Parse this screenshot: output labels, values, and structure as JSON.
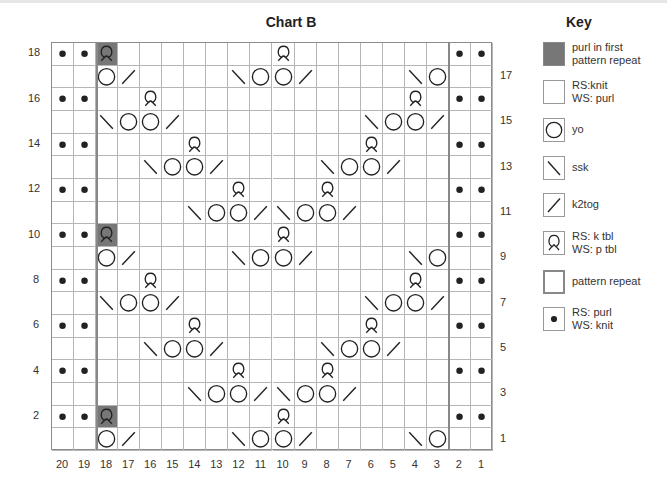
{
  "chart_data": {
    "type": "knitting-chart",
    "title": "Chart B",
    "columns": [
      20,
      19,
      18,
      17,
      16,
      15,
      14,
      13,
      12,
      11,
      10,
      9,
      8,
      7,
      6,
      5,
      4,
      3,
      2,
      1
    ],
    "row_labels_left": [
      18,
      16,
      14,
      12,
      10,
      8,
      6,
      4,
      2
    ],
    "row_labels_right": [
      17,
      15,
      13,
      11,
      9,
      7,
      5,
      3,
      1
    ],
    "pattern_repeat": {
      "from_col": 18,
      "to_col": 3
    },
    "legend_codes": {
      "P": "RS: purl / WS: knit (dot)",
      "Q": "RS: k tbl / WS: p tbl",
      "G": "purl in first pattern repeat + k tbl symbol (grey)",
      "O": "yo",
      "S": "ssk (\\)",
      "K": "k2tog (/)",
      ".": "RS: knit / WS: purl (empty)"
    },
    "rows": [
      {
        "row": 18,
        "cells": [
          "P",
          "P",
          "G",
          ".",
          ".",
          ".",
          ".",
          ".",
          ".",
          ".",
          "Q",
          ".",
          ".",
          ".",
          ".",
          ".",
          ".",
          ".",
          "P",
          "P"
        ]
      },
      {
        "row": 17,
        "cells": [
          ".",
          ".",
          "O",
          "K",
          ".",
          ".",
          ".",
          ".",
          "S",
          "O",
          "O",
          "K",
          ".",
          ".",
          ".",
          ".",
          "S",
          "O",
          ".",
          "."
        ]
      },
      {
        "row": 16,
        "cells": [
          "P",
          "P",
          ".",
          ".",
          "Q",
          ".",
          ".",
          ".",
          ".",
          ".",
          ".",
          ".",
          ".",
          ".",
          ".",
          ".",
          "Q",
          ".",
          "P",
          "P"
        ]
      },
      {
        "row": 15,
        "cells": [
          ".",
          ".",
          "S",
          "O",
          "O",
          "K",
          ".",
          ".",
          ".",
          ".",
          ".",
          ".",
          ".",
          ".",
          "S",
          "O",
          "O",
          "K",
          ".",
          "."
        ]
      },
      {
        "row": 14,
        "cells": [
          "P",
          "P",
          ".",
          ".",
          ".",
          ".",
          "Q",
          ".",
          ".",
          ".",
          ".",
          ".",
          ".",
          ".",
          "Q",
          ".",
          ".",
          ".",
          "P",
          "P"
        ]
      },
      {
        "row": 13,
        "cells": [
          ".",
          ".",
          ".",
          ".",
          "S",
          "O",
          "O",
          "K",
          ".",
          ".",
          ".",
          ".",
          "S",
          "O",
          "O",
          "K",
          ".",
          ".",
          ".",
          "."
        ]
      },
      {
        "row": 12,
        "cells": [
          "P",
          "P",
          ".",
          ".",
          ".",
          ".",
          ".",
          ".",
          "Q",
          ".",
          ".",
          ".",
          "Q",
          ".",
          ".",
          ".",
          ".",
          ".",
          "P",
          "P"
        ]
      },
      {
        "row": 11,
        "cells": [
          ".",
          ".",
          ".",
          ".",
          ".",
          ".",
          "S",
          "O",
          "O",
          "K",
          "S",
          "O",
          "O",
          "K",
          ".",
          ".",
          ".",
          ".",
          ".",
          "."
        ]
      },
      {
        "row": 10,
        "cells": [
          "P",
          "P",
          "G",
          ".",
          ".",
          ".",
          ".",
          ".",
          ".",
          ".",
          "Q",
          ".",
          ".",
          ".",
          ".",
          ".",
          ".",
          ".",
          "P",
          "P"
        ]
      },
      {
        "row": 9,
        "cells": [
          ".",
          ".",
          "O",
          "K",
          ".",
          ".",
          ".",
          ".",
          "S",
          "O",
          "O",
          "K",
          ".",
          ".",
          ".",
          ".",
          "S",
          "O",
          ".",
          "."
        ]
      },
      {
        "row": 8,
        "cells": [
          "P",
          "P",
          ".",
          ".",
          "Q",
          ".",
          ".",
          ".",
          ".",
          ".",
          ".",
          ".",
          ".",
          ".",
          ".",
          ".",
          "Q",
          ".",
          "P",
          "P"
        ]
      },
      {
        "row": 7,
        "cells": [
          ".",
          ".",
          "S",
          "O",
          "O",
          "K",
          ".",
          ".",
          ".",
          ".",
          ".",
          ".",
          ".",
          ".",
          "S",
          "O",
          "O",
          "K",
          ".",
          "."
        ]
      },
      {
        "row": 6,
        "cells": [
          "P",
          "P",
          ".",
          ".",
          ".",
          ".",
          "Q",
          ".",
          ".",
          ".",
          ".",
          ".",
          ".",
          ".",
          "Q",
          ".",
          ".",
          ".",
          "P",
          "P"
        ]
      },
      {
        "row": 5,
        "cells": [
          ".",
          ".",
          ".",
          ".",
          "S",
          "O",
          "O",
          "K",
          ".",
          ".",
          ".",
          ".",
          "S",
          "O",
          "O",
          "K",
          ".",
          ".",
          ".",
          "."
        ]
      },
      {
        "row": 4,
        "cells": [
          "P",
          "P",
          ".",
          ".",
          ".",
          ".",
          ".",
          ".",
          "Q",
          ".",
          ".",
          ".",
          "Q",
          ".",
          ".",
          ".",
          ".",
          ".",
          "P",
          "P"
        ]
      },
      {
        "row": 3,
        "cells": [
          ".",
          ".",
          ".",
          ".",
          ".",
          ".",
          "S",
          "O",
          "O",
          "K",
          "S",
          "O",
          "O",
          "K",
          ".",
          ".",
          ".",
          ".",
          ".",
          "."
        ]
      },
      {
        "row": 2,
        "cells": [
          "P",
          "P",
          "G",
          ".",
          ".",
          ".",
          ".",
          ".",
          ".",
          ".",
          "Q",
          ".",
          ".",
          ".",
          ".",
          ".",
          ".",
          ".",
          "P",
          "P"
        ]
      },
      {
        "row": 1,
        "cells": [
          ".",
          ".",
          "O",
          "K",
          ".",
          ".",
          ".",
          ".",
          "S",
          "O",
          "O",
          "K",
          ".",
          ".",
          ".",
          ".",
          "S",
          "O",
          ".",
          "."
        ]
      }
    ]
  },
  "chart": {
    "title": "Chart B"
  },
  "key": {
    "title": "Key",
    "items": [
      {
        "symbol": "grey-square",
        "label": "purl in first\npattern repeat"
      },
      {
        "symbol": "empty-square",
        "label": "RS:knit\nWS: purl"
      },
      {
        "symbol": "circle",
        "label": "yo"
      },
      {
        "symbol": "backslash",
        "label": "ssk"
      },
      {
        "symbol": "slash",
        "label": "k2tog"
      },
      {
        "symbol": "twisted-loop",
        "label": "RS: k tbl\nWS: p tbl"
      },
      {
        "symbol": "repeat-box",
        "label": "pattern repeat"
      },
      {
        "symbol": "dot",
        "label": "RS: purl\nWS: knit"
      }
    ]
  },
  "colors": {
    "grey_cell": "#777777",
    "grid_line": "#b5b5b5",
    "symbol": "#222222"
  }
}
